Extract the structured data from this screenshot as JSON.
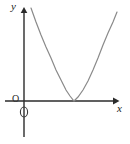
{
  "figure": {
    "kind": "coordinate-plane-parabola-sketch",
    "background_color": "#ffffff",
    "curve_color": "#8a8a8a",
    "axis_color": "#2b2b2b",
    "label_color": "#1a1a1a"
  },
  "labels": {
    "y_axis": "y",
    "x_axis": "x",
    "origin": "O",
    "y_axis_marker": "0"
  },
  "chart_data": {
    "type": "line",
    "title": "",
    "xlabel": "x",
    "ylabel": "y",
    "grid": false,
    "legend": null,
    "annotations": [
      "O"
    ],
    "axes": {
      "x_axis_y_pixel": 101,
      "y_axis_x_pixel": 24,
      "x_axis_from_pixel": 5,
      "x_axis_to_pixel": 115,
      "y_axis_from_pixel": 8,
      "y_axis_to_pixel": 137,
      "x_arrow": "right",
      "y_arrow": "up"
    },
    "series": [
      {
        "name": "parabola",
        "description": "upward-opening parabola tangent to the x-axis at its vertex, lying entirely to the right of the y-axis",
        "vertex_pixel": [
          74,
          101
        ],
        "points_pixel": [
          [
            31,
            8
          ],
          [
            36,
            22
          ],
          [
            41,
            35
          ],
          [
            46,
            47
          ],
          [
            51,
            58
          ],
          [
            56,
            70
          ],
          [
            61,
            80
          ],
          [
            66,
            90
          ],
          [
            70,
            96
          ],
          [
            74,
            101
          ],
          [
            78,
            97
          ],
          [
            83,
            90
          ],
          [
            88,
            81
          ],
          [
            93,
            70
          ],
          [
            98,
            58
          ],
          [
            103,
            45
          ],
          [
            108,
            33
          ],
          [
            113,
            22
          ],
          [
            117,
            12
          ]
        ]
      }
    ]
  }
}
